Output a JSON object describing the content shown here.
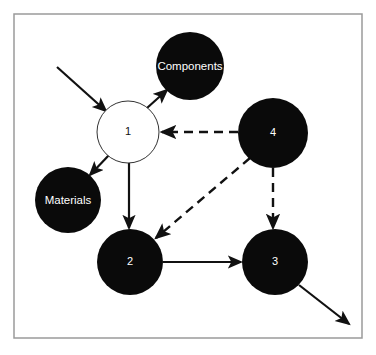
{
  "canvas": {
    "width": 376,
    "height": 355,
    "background": "#ffffff"
  },
  "frame": {
    "name": "diagram-border",
    "x": 14,
    "y": 14,
    "width": 348,
    "height": 324,
    "stroke": "#9a9a9a",
    "stroke_width": 1.5,
    "fill": "#ffffff"
  },
  "style": {
    "node_fill_dark": "#0a0a0a",
    "node_fill_light": "#ffffff",
    "node_stroke_light": "#333333",
    "label_color": "#ffffff",
    "number_color_dark_node": "#ffffff",
    "number_color_light_node": "#111111",
    "edge_color": "#111111"
  },
  "nodes": [
    {
      "id": "node-components",
      "label": "Components",
      "cx": 190,
      "cy": 66,
      "r": 34,
      "fill": "dark",
      "label_kind": "word"
    },
    {
      "id": "node-materials",
      "label": "Materials",
      "cx": 68,
      "cy": 200,
      "r": 33,
      "fill": "dark",
      "label_kind": "word"
    },
    {
      "id": "node-1",
      "label": "1",
      "cx": 128,
      "cy": 132,
      "r": 31,
      "fill": "light",
      "label_kind": "number"
    },
    {
      "id": "node-4",
      "label": "4",
      "cx": 273,
      "cy": 133,
      "r": 35,
      "fill": "dark",
      "label_kind": "number"
    },
    {
      "id": "node-2",
      "label": "2",
      "cx": 130,
      "cy": 262,
      "r": 33,
      "fill": "dark",
      "label_kind": "number"
    },
    {
      "id": "node-3",
      "label": "3",
      "cx": 275,
      "cy": 262,
      "r": 33,
      "fill": "dark",
      "label_kind": "number"
    }
  ],
  "edges": [
    {
      "id": "edge-external-in-to-1",
      "from": "external-input",
      "to": "node-1",
      "style": "solid",
      "x1": 57,
      "y1": 67,
      "x2": 106,
      "y2": 111,
      "arrow": "end"
    },
    {
      "id": "edge-1-to-components",
      "from": "node-1",
      "to": "node-components",
      "style": "solid",
      "x1": 147,
      "y1": 108,
      "x2": 167,
      "y2": 90,
      "arrow": "end"
    },
    {
      "id": "edge-1-to-materials",
      "from": "node-1",
      "to": "node-materials",
      "style": "solid",
      "x1": 110,
      "y1": 154,
      "x2": 90,
      "y2": 175,
      "arrow": "end"
    },
    {
      "id": "edge-1-to-2",
      "from": "node-1",
      "to": "node-2",
      "style": "solid",
      "x1": 129,
      "y1": 163,
      "x2": 129,
      "y2": 228,
      "arrow": "end"
    },
    {
      "id": "edge-4-to-1",
      "from": "node-4",
      "to": "node-1",
      "style": "dashed",
      "x1": 238,
      "y1": 132,
      "x2": 162,
      "y2": 132,
      "arrow": "end"
    },
    {
      "id": "edge-4-to-2",
      "from": "node-4",
      "to": "node-2",
      "style": "dashed",
      "x1": 250,
      "y1": 158,
      "x2": 156,
      "y2": 238,
      "arrow": "end"
    },
    {
      "id": "edge-4-to-3",
      "from": "node-4",
      "to": "node-3",
      "style": "dashed",
      "x1": 273,
      "y1": 168,
      "x2": 273,
      "y2": 228,
      "arrow": "end"
    },
    {
      "id": "edge-2-to-3",
      "from": "node-2",
      "to": "node-3",
      "style": "solid",
      "x1": 163,
      "y1": 262,
      "x2": 241,
      "y2": 262,
      "arrow": "end"
    },
    {
      "id": "edge-3-to-external-out",
      "from": "node-3",
      "to": "external-output",
      "style": "solid",
      "x1": 299,
      "y1": 285,
      "x2": 349,
      "y2": 324,
      "arrow": "end"
    }
  ]
}
